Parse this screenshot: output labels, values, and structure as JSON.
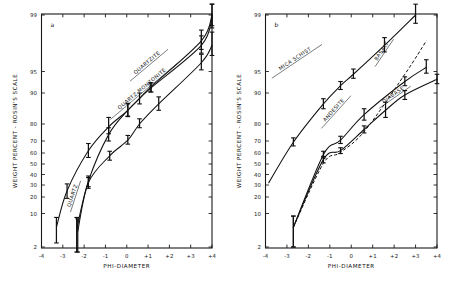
{
  "figure": {
    "width": 456,
    "height": 293,
    "background": "#ffffff",
    "ink_color": "#111111"
  },
  "chart_data": [
    {
      "id": "panel-a",
      "type": "line",
      "panel_label": "a",
      "title": "",
      "xlabel": "PHI-DIAMETER",
      "ylabel": "WEIGHT PERCENT - ROSIN'S SCALE",
      "y_scale": "rosin-probability",
      "xlim": [
        -4,
        4
      ],
      "ylim": [
        2,
        99
      ],
      "grid": false,
      "legend_position": "inline-along-curves",
      "xticks": [
        -4,
        -3,
        -2,
        -1,
        0,
        1,
        2,
        3,
        4
      ],
      "xticklabels": [
        "-4",
        "-3",
        "-2",
        "-1",
        "0",
        "+1",
        "+2",
        "+3",
        "+4"
      ],
      "yticks": [
        2,
        10,
        20,
        30,
        40,
        50,
        60,
        70,
        80,
        90,
        95,
        99
      ],
      "yticklabels": [
        "2",
        "10",
        "20",
        "30",
        "40",
        "50",
        "60",
        "70",
        "80",
        "90",
        "95",
        "99"
      ],
      "series": [
        {
          "name": "QUARTZITE",
          "style": "solid",
          "x": [
            -3.3,
            -2.8,
            -1.8,
            -0.85,
            0.05,
            1.1,
            3.5,
            4.0
          ],
          "values": [
            5.5,
            25.0,
            62.0,
            78.5,
            85.0,
            91.5,
            97.8,
            99.0
          ],
          "errors": [
            3.0,
            6.0,
            6.0,
            4.0,
            2.0,
            1.2,
            0.6,
            0.4
          ]
        },
        {
          "name": "QUARTZ",
          "style": "solid",
          "x": [
            -2.35,
            -1.8,
            -0.85,
            0.05,
            0.6,
            1.15,
            3.5,
            4.0
          ],
          "values": [
            5.0,
            33.5,
            74.0,
            85.0,
            88.5,
            91.5,
            97.5,
            98.9
          ],
          "errors": [
            3.5,
            5.0,
            4.0,
            2.2,
            1.5,
            1.2,
            0.6,
            0.4
          ]
        },
        {
          "name": "QUARTZ MONZONITE",
          "style": "solid",
          "x": [
            -2.3,
            -1.8,
            -0.8,
            0.05,
            0.6,
            1.5,
            3.5,
            4.0
          ],
          "values": [
            4.5,
            32.0,
            57.5,
            70.5,
            80.0,
            87.0,
            96.0,
            97.5
          ],
          "errors": [
            3.5,
            5.0,
            4.0,
            3.0,
            2.0,
            2.0,
            0.8,
            0.8
          ]
        }
      ]
    },
    {
      "id": "panel-b",
      "type": "line",
      "panel_label": "b",
      "title": "",
      "xlabel": "PHI-DIAMETER",
      "ylabel": "WEIGHT PERCENT - ROSIN'S SCALE",
      "y_scale": "rosin-probability",
      "xlim": [
        -4,
        4
      ],
      "ylim": [
        2,
        99
      ],
      "grid": false,
      "legend_position": "inline-along-curves",
      "xticks": [
        -4,
        -3,
        -2,
        -1,
        0,
        1,
        2,
        3,
        4
      ],
      "xticklabels": [
        "-4",
        "-3",
        "-2",
        "-1",
        "0",
        "+1",
        "+2",
        "+3",
        "+4"
      ],
      "yticks": [
        2,
        10,
        20,
        30,
        40,
        50,
        60,
        70,
        80,
        90,
        95,
        99
      ],
      "yticklabels": [
        "2",
        "10",
        "20",
        "30",
        "40",
        "50",
        "60",
        "70",
        "80",
        "90",
        "95",
        "99"
      ],
      "series": [
        {
          "name": "MICA SCHIST",
          "style": "solid",
          "x": [
            -3.85,
            -2.7,
            -1.3,
            -0.5,
            0.1,
            1.55,
            3.0
          ],
          "values": [
            32.0,
            69.0,
            87.0,
            92.0,
            94.5,
            97.5,
            99.0
          ],
          "errors": [
            0.0,
            3.0,
            1.5,
            1.0,
            0.8,
            0.5,
            0.3
          ]
        },
        {
          "name": "ANDESITE",
          "style": "solid",
          "x": [
            -2.7,
            -1.3,
            -0.5,
            0.6,
            2.5,
            3.5
          ],
          "values": [
            5.5,
            58.5,
            70.5,
            83.5,
            93.0,
            95.5
          ],
          "errors": [
            3.5,
            3.0,
            2.5,
            2.0,
            1.0,
            0.8
          ]
        },
        {
          "name": "BASALT",
          "style": "dashed",
          "x": [
            -2.7,
            -1.3,
            -0.5,
            0.65,
            2.5,
            3.5
          ],
          "values": [
            5.5,
            50.5,
            60.5,
            76.5,
            94.5,
            97.8
          ]
        },
        {
          "name": "DIABASE",
          "style": "solid",
          "x": [
            -2.7,
            -1.3,
            -0.5,
            0.6,
            1.6,
            2.5,
            4.0
          ],
          "values": [
            5.5,
            54.0,
            62.0,
            77.0,
            85.0,
            89.5,
            93.5
          ],
          "errors": [
            3.5,
            3.0,
            2.5,
            2.0,
            2.5,
            1.2,
            1.0
          ]
        }
      ]
    }
  ]
}
